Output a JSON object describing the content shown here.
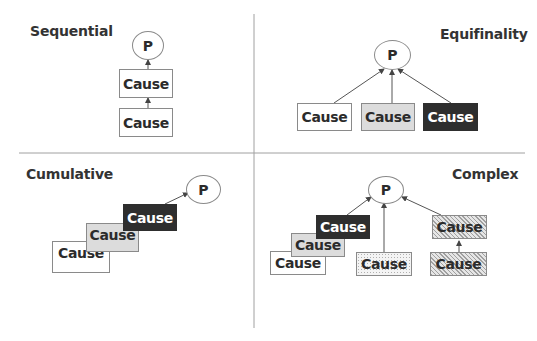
{
  "colors": {
    "box_white": "#ffffff",
    "box_gray": "#dcdcdc",
    "box_black": "#2e2e2e",
    "box_text": "#2b2b2b",
    "title_text": "#333333",
    "divider": "#9a9a9a",
    "arrow": "#555555"
  },
  "quadrants": {
    "sequential": {
      "title": "Sequential",
      "outcome": "P",
      "causes": [
        {
          "label": "Cause",
          "style": "white"
        },
        {
          "label": "Cause",
          "style": "white"
        }
      ]
    },
    "equifinality": {
      "title": "Equifinality",
      "outcome": "P",
      "causes": [
        {
          "label": "Cause",
          "style": "white"
        },
        {
          "label": "Cause",
          "style": "gray"
        },
        {
          "label": "Cause",
          "style": "black"
        }
      ]
    },
    "cumulative": {
      "title": "Cumulative",
      "outcome": "P",
      "causes": [
        {
          "label": "Cause",
          "style": "white"
        },
        {
          "label": "Cause",
          "style": "gray"
        },
        {
          "label": "Cause",
          "style": "black"
        }
      ]
    },
    "complex": {
      "title": "Complex",
      "outcome": "P",
      "causes": [
        {
          "label": "Cause",
          "style": "white"
        },
        {
          "label": "Cause",
          "style": "gray"
        },
        {
          "label": "Cause",
          "style": "black"
        },
        {
          "label": "Cause",
          "style": "dotted"
        },
        {
          "label": "Cause",
          "style": "hatched"
        },
        {
          "label": "Cause",
          "style": "hatched"
        }
      ]
    }
  }
}
